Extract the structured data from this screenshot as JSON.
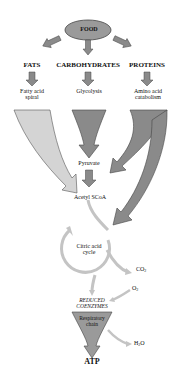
{
  "diagram": {
    "root": "FOOD",
    "categories": [
      {
        "name": "FATS",
        "process": "Fatty acid spiral"
      },
      {
        "name": "CARBOHYDRATES",
        "process": "Glycolysis"
      },
      {
        "name": "PROTEINS",
        "process": "Amino acid catabolism"
      }
    ],
    "intermediates": {
      "pyruvate": "Pyruvate",
      "acetyl": "Acetyl SCoA",
      "cycle_line1": "Citric acid",
      "cycle_line2": "cycle",
      "co2": "CO",
      "co2_sub": "2",
      "o2": "O",
      "o2_sub": "2",
      "reduced_line1": "REDUCED",
      "reduced_line2": "COENZYMES",
      "resp_line1": "Respiratory",
      "resp_line2": "chain",
      "h2o_a": "H",
      "h2o_sub": "2",
      "h2o_b": "O",
      "atp": "ATP"
    },
    "labels": {
      "fats": "FATS",
      "carbs": "CARBOHYDRATES",
      "proteins": "PROTEINS",
      "fatty_line1": "Fatty acid",
      "fatty_line2": "spiral",
      "glycolysis": "Glycolysis",
      "amino_line1": "Amino acid",
      "amino_line2": "catabolism"
    },
    "colors": {
      "ellipse": "#9a9a9a",
      "dark_arrow": "#8a8a8a",
      "light_arrow": "#d4d4d4",
      "cycle": "#c4c4c4",
      "outline": "#555555"
    }
  }
}
